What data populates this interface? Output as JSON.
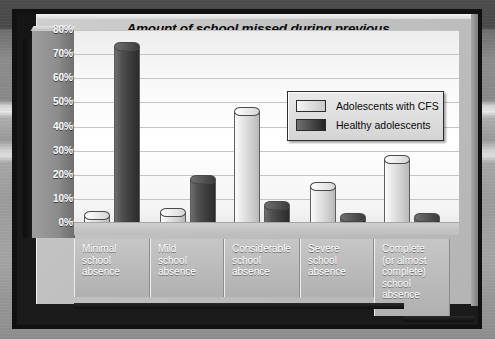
{
  "chart_data": {
    "type": "bar",
    "title": "Amount of school missed during previous six months—CFS sufferers versus healthy adolescents",
    "title_lines": [
      "Amount of school missed during previous",
      "six months—CFS sufferers versus",
      "healthy adolescents"
    ],
    "xlabel": "",
    "ylabel": "",
    "ylim": [
      0,
      80
    ],
    "ytick_step": 10,
    "ytick_labels": [
      "80%",
      "70%",
      "60%",
      "50%",
      "40%",
      "30%",
      "20%",
      "10%",
      "0%"
    ],
    "grid": true,
    "legend_position": "upper-right",
    "categories": [
      "Minimal school absence",
      "Mild school absence",
      "Considerable school absence",
      "Severe school absence",
      "Complete (or almost complete) school absence"
    ],
    "category_lines": [
      [
        "Minimal",
        "school",
        "absence"
      ],
      [
        "Mild",
        "school",
        "absence"
      ],
      [
        "Considerable",
        "school",
        "absence"
      ],
      [
        "Severe",
        "school",
        "absence"
      ],
      [
        "Complete",
        "(or almost",
        "complete)",
        "school",
        "absence"
      ]
    ],
    "series": [
      {
        "name": "Adolescents with CFS",
        "color": "#d8d8d8",
        "values": [
          3,
          4,
          46,
          15,
          26
        ]
      },
      {
        "name": "Healthy adolescents",
        "color": "#3a3a3a",
        "values": [
          73,
          18,
          7,
          1,
          1
        ]
      }
    ]
  },
  "legend": {
    "items": [
      {
        "label": "Adolescents with CFS",
        "swatch": "light"
      },
      {
        "label": "Healthy adolescents",
        "swatch": "dark"
      }
    ]
  },
  "colors": {
    "series_cfs": "#d8d8d8",
    "series_healthy": "#3a3a3a",
    "panel": "#c2c2c2",
    "plot_bg": "#ffffff",
    "gridline": "#c4c4c4",
    "axis_text": "#ffffff",
    "title_text": "#0b0b0b"
  }
}
